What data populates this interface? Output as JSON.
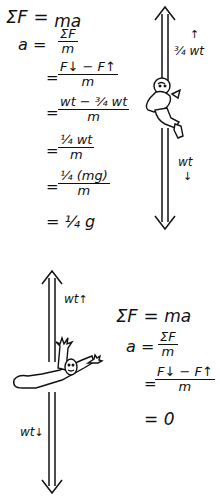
{
  "panel_top": {
    "equations": {
      "line1_lhs": "ΣF",
      "line1_eq": "=",
      "line1_rhs": "ma",
      "line2_lhs": "a",
      "line2_eq": "=",
      "line2_num": "ΣF",
      "line2_den": "m",
      "line3_eq": "=",
      "line3_num": "F↓ − F↑",
      "line3_den": "m",
      "line4_eq": "=",
      "line4_num": "wt − ¾ wt",
      "line4_den": "m",
      "line5_eq": "=",
      "line5_num": "¼ wt",
      "line5_den": "m",
      "line6_eq": "=",
      "line6_num": "¼ (mg)",
      "line6_den": "m",
      "line7_eq": "=",
      "line7_rhs": "¼ g"
    },
    "force_labels": {
      "up": "¾ wt",
      "up_arrow": "↑",
      "down": "wt",
      "down_arrow": "↓"
    },
    "figure": "climber-sliding-down-rope"
  },
  "panel_bottom": {
    "equations": {
      "line1_lhs": "ΣF",
      "line1_eq": "=",
      "line1_rhs": "ma",
      "line2_lhs": "a",
      "line2_eq": "=",
      "line2_num": "ΣF",
      "line2_den": "m",
      "line3_eq": "=",
      "line3_num": "F↓ − F↑",
      "line3_den": "m",
      "line4_eq": "=",
      "line4_rhs": "0"
    },
    "force_labels": {
      "up": "wt",
      "up_arrow": "↑",
      "down": "wt",
      "down_arrow": "↓"
    },
    "figure": "person-holding-rope-at-rest"
  }
}
